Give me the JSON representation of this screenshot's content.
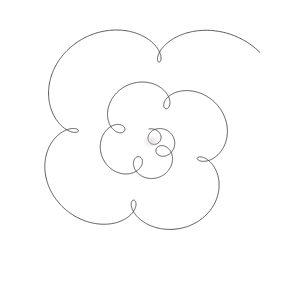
{
  "artwork": {
    "title": "Spirograph Rosette",
    "kind": "line-drawing",
    "medium": "pen on paper",
    "background_color": "#ffffff",
    "stroke_color": "#3a3a3c",
    "stroke_width": 0.85,
    "canvas": {
      "width": 302,
      "height": 284
    },
    "center": {
      "x": 150,
      "y": 143
    },
    "description": "Hand-drawn continuous spiral curve with five-fold rotational symmetry; five small teardrop loops near the centre opening out into progressively larger overlapping circles toward the rim.",
    "symmetry_order": 5,
    "loop_count": 5,
    "extents": {
      "left": 6,
      "top": 9,
      "right": 297,
      "bottom": 279
    },
    "curve": {
      "type": "epitrochoid-spiral",
      "petals": 5,
      "turns": 9,
      "samples_per_turn": 260,
      "arm_start": 6,
      "arm_end": 118,
      "offset_start": 9,
      "offset_end": 26,
      "rotation_per_turn_deg": 14,
      "phase_deg": -95,
      "squash_x": 1.0,
      "squash_y": 0.955,
      "jitter_amplitude": 0.7,
      "jitter_frequency": 3.1
    }
  }
}
